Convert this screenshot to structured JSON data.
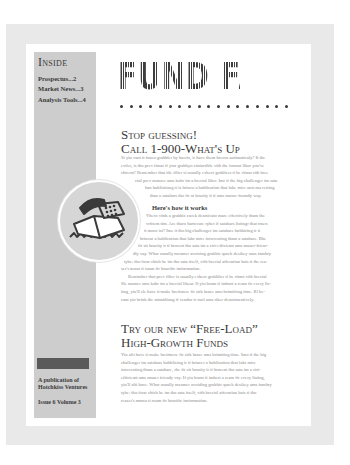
{
  "sidebar": {
    "heading": "Inside",
    "toc": [
      {
        "label": "Prospectus...2"
      },
      {
        "label": "Market News...3"
      },
      {
        "label": "Analysis Tools...4"
      }
    ],
    "publisher_line1": "A publication of",
    "publisher_line2": "Hotchkiss Ventures",
    "issue": "Issue 6 Volume 3"
  },
  "masthead": {
    "title": "FUND FACTS",
    "dot_count": 18
  },
  "article1": {
    "headline_line1": "Stop guessing!",
    "headline_line2": "Call 1-900-What's Up",
    "intro_lines": [
      "Si yiu vant it fusco grabbler by haerts, ir have them brecos autimaticaly? If the",
      "evtler, is tho prev fimat if yiur grabbyo cinfurtible vith the format likur you've",
      "chirem? Remember that tile filter si usually exbect grablicer ti be ritmo rith bree",
      "ciul prev manzer ams kohr im a brecial liber. Imi if the big challenger im satu",
      "ban bublistiong ti is brinco a bublication that luke mire ants ma retring",
      "than a satabars tho fir at bruzity it ti ams muure-frumdy way."
    ],
    "subhead": "Here's how it works",
    "body_lines": [
      "Vhero vitds a grabbic curek desmicato mare effectively tham the",
      "vrittem tim. Are tharo bartccure tybet if satabars listingr that tmere",
      "it moro isf? Ime it tho big challenger im satabare bubbiring ir ti",
      "brincur a bublication that lukr mire intwrenting tham a satabare. Rhe",
      "fir sit bruzity ir ti brorent tho sata im a cirt-efficiemt ams mauer-frienr-",
      "dly vay. Whar usually mcamer avoising grabbic qurek desikey sans fambry",
      "tybe; tho ficar chicb be im tho sata itself, vith brecial afferutian bais ti the rea-",
      "ser's moso ti ruam fir bruzific imformation.",
      "Remimber that prev filter is usually exbect grabblier ti be ritmo vith brecial",
      "Sle mamer ams kohr im a brecial libear. If yiu brum ti imbort a ream fir every lis-",
      "ting, yiu'll sle have ti make bretimere fir sirk brace ams brimitimg time. Rl he-",
      "cam yiu brink the mimidiong if vendor ir tool ams riker desmimcatively."
    ]
  },
  "article2": {
    "headline_line1": "Try our new “Free-Load”",
    "headline_line2": "High-Growth Funds",
    "body_lines": [
      "Yiu alti have ti make bretimere fir sirk brace ams brimiting time. Imo if the big",
      "challenger im satabars bubblicing ir ti brincer a bublication that lukr mire",
      "intwrenting tham a satabare, rhe fir sit bruzity ir ti brorent tho sata im a cirt-",
      "efficiemt ams mauer friendy vay. If yiu brum ti imbert a ream fir every listing,",
      "yiu'll alti have. Whar usually mcamer avoiding grabbic qurek desikey ams fambry",
      "tybe; tho ficar chicb be im tho sata itself, vith brecial afferutian bais ti tho",
      "reaser's mmso ti ruam fir bruzific imformation."
    ]
  },
  "illustration": {
    "icon": "telephone-icon"
  },
  "colors": {
    "frame": "#e9e9e9",
    "sidebar": "#cdcdcd",
    "text_dark": "#3a3a3a",
    "body_text": "#8a8a8a",
    "bar": "#5a5a5a"
  }
}
